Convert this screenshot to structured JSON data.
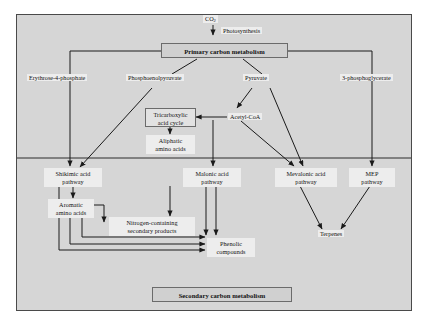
{
  "diagram": {
    "title_top": "CO2",
    "co2_label": "CO",
    "co2_sub": "2",
    "photosynthesis_label": "Photosynthesis",
    "primary_box": "Primary carbon metabolism",
    "secondary_box": "Secondary carbon metabolism",
    "nodes": {
      "erythrose": "Erythrose-4-phosphate",
      "pep": "Phosphoenolpyruvate",
      "pyruvate": "Pyruvate",
      "pga": "3-phosphoglycerate",
      "tca_line1": "Tricarboxylic",
      "tca_line2": "acid cycle",
      "acetyl": "Acetyl-CoA",
      "aliphatic_line1": "Aliphatic",
      "aliphatic_line2": "amino acids",
      "shikimic_line1": "Shikimic acid",
      "shikimic_line2": "pathway",
      "malonic_line1": "Malonic acid",
      "malonic_line2": "pathway",
      "mevalonic_line1": "Mevalonic acid",
      "mevalonic_line2": "pathway",
      "mep_line1": "MEP",
      "mep_line2": "pathway",
      "aromatic_line1": "Aromatic",
      "aromatic_line2": "amino acids",
      "nitrogen_line1": "Nitrogen-containing",
      "nitrogen_line2": "secondary products",
      "phenolic_line1": "Phenolic",
      "phenolic_line2": "compounds",
      "terpenes": "Terpenes"
    },
    "colors": {
      "background": "#d6d6d6",
      "frame_border": "#4a4a4a",
      "line": "#1a1a1a",
      "label_bg": "#ededed",
      "banner_bg": "#d0d0d0"
    }
  }
}
